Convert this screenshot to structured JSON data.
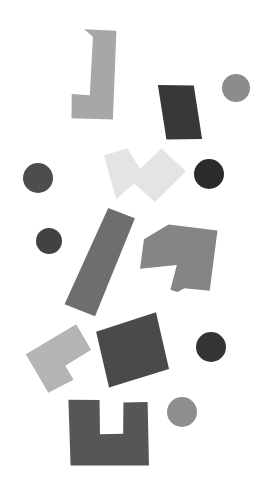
{
  "canvas": {
    "width": 279,
    "height": 494,
    "background_color": "#ffffff",
    "title": "Abstract Grayscale Geometric Shapes",
    "description": "Scattered arrangement of rotated polyomino tiles and circles in shades of gray on a white background"
  },
  "palette": {
    "background": "#ffffff",
    "very_light_gray": "#e4e4e4",
    "light_gray": "#b4b4b4",
    "medium_light_gray": "#a7a7a7",
    "medium_gray": "#8c8c8c",
    "mid_gray": "#858585",
    "gray": "#6e6e6e",
    "dark_gray": "#565656",
    "darker_gray": "#4a4a4a",
    "charcoal": "#424242",
    "very_dark_gray": "#383838",
    "near_black": "#2b2b2b"
  },
  "shapes": [
    {
      "id": "shape-l-tetromino-top",
      "name": "l-tetromino-top",
      "kind": "polygon",
      "label": "L tetromino",
      "color": "#a7a7a7",
      "rotation_deg": 10,
      "center": {
        "x": 107,
        "y": 84
      },
      "points": "75,34 107,30 119,118 78,124 74,100 92,98 85,40"
    },
    {
      "id": "shape-rect-dark-top",
      "name": "dark-rectangle-top",
      "kind": "polygon",
      "label": "Rotated dark rectangle",
      "color": "#383838",
      "rotation_deg": -12,
      "center": {
        "x": 180,
        "y": 112
      },
      "points": "164,81 199,89 196,143 161,136"
    },
    {
      "id": "shape-circle-top-right",
      "name": "circle-top-right",
      "kind": "circle",
      "label": "Medium gray circle",
      "color": "#8c8c8c",
      "center": {
        "x": 236,
        "y": 88
      },
      "radius": 14
    },
    {
      "id": "shape-s-tetromino-light",
      "name": "s-tetromino-light",
      "kind": "polygon",
      "label": "S tetromino (very light)",
      "color": "#e4e4e4",
      "rotation_deg": -8,
      "center": {
        "x": 138,
        "y": 175
      },
      "points": "107,151 131,147 141,169 165,152 186,178 151,204 133,183 113,196"
    },
    {
      "id": "shape-circle-mid-right-dark",
      "name": "circle-mid-right-dark",
      "kind": "circle",
      "label": "Near black circle",
      "color": "#2b2b2b",
      "center": {
        "x": 209,
        "y": 174
      },
      "radius": 15
    },
    {
      "id": "shape-circle-mid-left",
      "name": "circle-mid-left",
      "kind": "circle",
      "label": "Dark gray circle",
      "color": "#4d4d4d",
      "center": {
        "x": 38,
        "y": 178
      },
      "radius": 15
    },
    {
      "id": "shape-circle-left-lower",
      "name": "circle-left-lower",
      "kind": "circle",
      "label": "Charcoal circle",
      "color": "#424242",
      "center": {
        "x": 49,
        "y": 241
      },
      "radius": 13
    },
    {
      "id": "shape-long-bar",
      "name": "long-diagonal-bar",
      "kind": "polygon",
      "label": "Long rotated bar",
      "color": "#6e6e6e",
      "rotation_deg": 9,
      "center": {
        "x": 92,
        "y": 259
      },
      "points": "100,206 128,212 104,315 72,308"
    },
    {
      "id": "shape-t-tetromino",
      "name": "t-tetromino",
      "kind": "polygon",
      "label": "T tetromino",
      "color": "#858585",
      "rotation_deg": -6,
      "center": {
        "x": 176,
        "y": 257
      },
      "points": "172,224 220,235 206,294 181,289 174,292 167,289 176,265 139,265 146,236"
    },
    {
      "id": "shape-v-tetromino-light",
      "name": "v-tetromino-light",
      "kind": "polygon",
      "label": "L / V shaped piece",
      "color": "#b4b4b4",
      "rotation_deg": 12,
      "center": {
        "x": 58,
        "y": 352
      },
      "points": "70,321 90,343 68,364 79,376 57,394 27,361"
    },
    {
      "id": "shape-square-dark",
      "name": "dark-square",
      "kind": "polygon",
      "label": "Rotated dark square",
      "color": "#4a4a4a",
      "rotation_deg": -8,
      "center": {
        "x": 132,
        "y": 350
      },
      "points": "99,327 161,316 166,374 104,384"
    },
    {
      "id": "shape-circle-bottom-right-dark",
      "name": "circle-bottom-right-dark",
      "kind": "circle",
      "label": "Near black circle",
      "color": "#343434",
      "center": {
        "x": 211,
        "y": 347
      },
      "radius": 15
    },
    {
      "id": "shape-u-piece",
      "name": "u-shaped-piece",
      "kind": "polygon",
      "label": "U shaped piece",
      "color": "#565656",
      "rotation_deg": 6,
      "center": {
        "x": 97,
        "y": 434
      },
      "points": "65,403 96,400 100,434 123,431 120,400 144,397 152,460 74,468"
    },
    {
      "id": "shape-circle-bottom-mid",
      "name": "circle-bottom-mid",
      "kind": "circle",
      "label": "Medium gray circle",
      "color": "#8e8e8e",
      "center": {
        "x": 182,
        "y": 412
      },
      "radius": 15
    }
  ]
}
